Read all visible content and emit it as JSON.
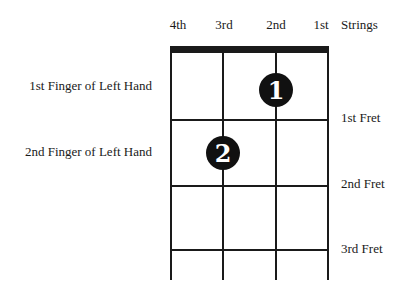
{
  "diagram": {
    "strings": [
      "4th",
      "3rd",
      "2nd",
      "1st"
    ],
    "strings_label": "Strings",
    "frets": [
      "1st Fret",
      "2nd Fret",
      "3rd Fret"
    ],
    "fingers": [
      {
        "label": "1st Finger of Left Hand",
        "number": "1",
        "string": "2nd",
        "fret": 1
      },
      {
        "label": "2nd Finger of Left Hand",
        "number": "2",
        "string": "3rd",
        "fret": 2
      }
    ],
    "colors": {
      "ink": "#1a1a1a",
      "dot": "#111111",
      "dot_text": "#ffffff",
      "background": "#ffffff"
    }
  }
}
